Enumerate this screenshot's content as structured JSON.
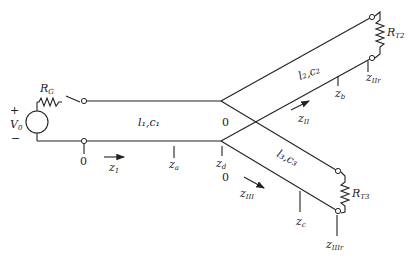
{
  "diagram": {
    "source": {
      "label": "V",
      "sub": "0",
      "plus": "+",
      "minus": "−"
    },
    "generator_resistor": {
      "label": "R",
      "sub": "G"
    },
    "line1": {
      "label": "l₁,c₁",
      "origin": "0",
      "coord": "z",
      "coord_sub": "1",
      "point_a": "z",
      "point_a_sub": "a",
      "point_d": "z",
      "point_d_sub": "d"
    },
    "line2": {
      "label": "l₂,c₂",
      "origin": "0",
      "coord": "z",
      "coord_sub": "II",
      "point_b": "z",
      "point_b_sub": "b",
      "end": "z",
      "end_sub": "IIr",
      "load": "R",
      "load_sub": "T2"
    },
    "line3": {
      "label": "l₃,c₃",
      "origin": "0",
      "coord": "z",
      "coord_sub": "III",
      "point_c": "z",
      "point_c_sub": "c",
      "end": "z",
      "end_sub": "IIIr",
      "load": "R",
      "load_sub": "T3"
    }
  }
}
